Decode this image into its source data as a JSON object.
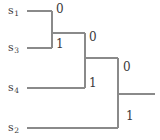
{
  "diagram": {
    "type": "binary-coding-tree",
    "stroke_color": "#8a8a8a",
    "text_color": "#3a3a3a",
    "leaves": [
      {
        "id": "s1",
        "symbol": "s",
        "subscript": "1",
        "x": 8,
        "y": 5,
        "line_y": 11,
        "line_x1": 27,
        "line_x2": 52
      },
      {
        "id": "s3",
        "symbol": "s",
        "subscript": "3",
        "x": 8,
        "y": 42,
        "line_y": 48,
        "line_x1": 27,
        "line_x2": 52
      },
      {
        "id": "s4",
        "symbol": "s",
        "subscript": "4",
        "x": 8,
        "y": 82,
        "line_y": 88,
        "line_x1": 27,
        "line_x2": 85
      },
      {
        "id": "s2",
        "symbol": "s",
        "subscript": "2",
        "x": 8,
        "y": 122,
        "line_y": 128,
        "line_x1": 27,
        "line_x2": 118
      }
    ],
    "internal_nodes": [
      {
        "id": "n1",
        "vx": 52,
        "vy_top": 11,
        "vy_bottom": 48,
        "out_y": 33,
        "out_x2": 85
      },
      {
        "id": "n2",
        "vx": 85,
        "vy_top": 33,
        "vy_bottom": 88,
        "out_y": 58,
        "out_x2": 118
      },
      {
        "id": "n3",
        "vx": 118,
        "vy_top": 58,
        "vy_bottom": 128,
        "out_y": 94,
        "out_x2": 155
      }
    ],
    "edge_labels": [
      {
        "id": "e-n1-0",
        "text": "0",
        "x": 56,
        "y": 3
      },
      {
        "id": "e-n1-1",
        "text": "1",
        "x": 56,
        "y": 38
      },
      {
        "id": "e-n2-0",
        "text": "0",
        "x": 89,
        "y": 31
      },
      {
        "id": "e-n2-1",
        "text": "1",
        "x": 89,
        "y": 77
      },
      {
        "id": "e-n3-0",
        "text": "0",
        "x": 123,
        "y": 61
      },
      {
        "id": "e-n3-1",
        "text": "1",
        "x": 126,
        "y": 110
      }
    ]
  }
}
